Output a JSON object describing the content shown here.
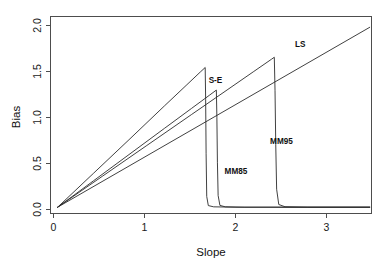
{
  "chart_data": {
    "type": "line",
    "title": "",
    "subtitle": "",
    "xlabel": "Slope",
    "ylabel": "Bias",
    "xlim": [
      -0.08,
      3.52
    ],
    "ylim": [
      -0.07,
      2.12
    ],
    "xticks": [
      0,
      1,
      2,
      3
    ],
    "xtick_labels": [
      "0",
      "1",
      "2",
      "3"
    ],
    "yticks": [
      0.0,
      0.5,
      1.0,
      1.5,
      2.0
    ],
    "ytick_labels": [
      "0.0",
      "0.5",
      "1.0",
      "1.5",
      "2.0"
    ],
    "grid": false,
    "legend": "inline-annotations",
    "annotations": [
      {
        "text": "LS",
        "x": 2.72,
        "y": 1.78
      },
      {
        "text": "S-E",
        "x": 1.77,
        "y": 1.38
      },
      {
        "text": "MM85",
        "x": 2.0,
        "y": 0.37
      },
      {
        "text": "MM95",
        "x": 2.51,
        "y": 0.7
      }
    ],
    "series": [
      {
        "name": "LS",
        "description": "Unbounded linear bias, rises without redescending",
        "points": [
          [
            0,
            0
          ],
          [
            3.5,
            2.0
          ]
        ]
      },
      {
        "name": "S-E",
        "description": "Rises to peak then drops abruptly to zero",
        "points": [
          [
            0,
            0
          ],
          [
            0.4,
            0.375
          ],
          [
            0.8,
            0.75
          ],
          [
            1.2,
            1.128
          ],
          [
            1.45,
            1.362
          ],
          [
            1.6,
            1.503
          ],
          [
            1.655,
            1.553
          ],
          [
            1.66,
            1.2
          ],
          [
            1.665,
            0.6
          ],
          [
            1.672,
            0.12
          ],
          [
            1.69,
            0.018
          ],
          [
            1.75,
            0.004
          ],
          [
            2.0,
            0.0
          ],
          [
            3.5,
            0.0
          ]
        ]
      },
      {
        "name": "MM85",
        "description": "Lower peak, redescends to zero near slope 1.8",
        "points": [
          [
            0,
            0
          ],
          [
            0.4,
            0.292
          ],
          [
            0.8,
            0.585
          ],
          [
            1.2,
            0.878
          ],
          [
            1.5,
            1.097
          ],
          [
            1.7,
            1.243
          ],
          [
            1.78,
            1.302
          ],
          [
            1.786,
            1.0
          ],
          [
            1.792,
            0.5
          ],
          [
            1.8,
            0.13
          ],
          [
            1.82,
            0.02
          ],
          [
            1.88,
            0.004
          ],
          [
            2.1,
            0.0
          ],
          [
            3.5,
            0.0
          ]
        ]
      },
      {
        "name": "MM95",
        "description": "Highest peak, redescends to zero near slope 2.45",
        "points": [
          [
            0,
            0
          ],
          [
            0.5,
            0.343
          ],
          [
            1.0,
            0.686
          ],
          [
            1.5,
            1.029
          ],
          [
            1.9,
            1.303
          ],
          [
            2.2,
            1.509
          ],
          [
            2.4,
            1.646
          ],
          [
            2.43,
            1.667
          ],
          [
            2.438,
            1.3
          ],
          [
            2.446,
            0.7
          ],
          [
            2.456,
            0.2
          ],
          [
            2.48,
            0.03
          ],
          [
            2.55,
            0.005
          ],
          [
            2.8,
            0.0
          ],
          [
            3.5,
            0.0
          ]
        ]
      }
    ]
  }
}
